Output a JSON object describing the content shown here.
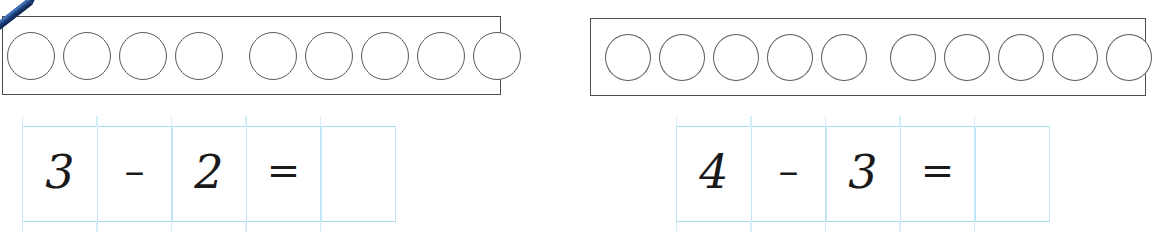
{
  "page": {
    "background_color": "#ffffff"
  },
  "colors": {
    "box_border": "#4d4d4d",
    "counter_outline": "#5a5a5a",
    "grid_line": "#a8dcef",
    "grid_line_light": "#d5eef8",
    "handwriting_ink": "#1a1a1a",
    "pencil_body": "#1f3f7a",
    "pencil_highlight": "#3f6fb5",
    "pencil_dark": "#132b55"
  },
  "decorations": {
    "pencil": {
      "icon": "pencil-icon",
      "position": "top-left-corner"
    }
  },
  "problems": [
    {
      "id": "problem-1",
      "counter_strip": {
        "total": 9,
        "groups": [
          {
            "count": 4,
            "filled": false
          },
          {
            "count": 5,
            "filled": false
          }
        ]
      },
      "equation": {
        "cells": [
          {
            "type": "number",
            "text": "3"
          },
          {
            "type": "operator",
            "text": "–"
          },
          {
            "type": "number",
            "text": "2"
          },
          {
            "type": "operator",
            "text": "="
          },
          {
            "type": "answer",
            "text": ""
          }
        ]
      }
    },
    {
      "id": "problem-2",
      "counter_strip": {
        "total": 10,
        "groups": [
          {
            "count": 5,
            "filled": false
          },
          {
            "count": 5,
            "filled": false
          }
        ]
      },
      "equation": {
        "cells": [
          {
            "type": "number",
            "text": "4"
          },
          {
            "type": "operator",
            "text": "–"
          },
          {
            "type": "number",
            "text": "3"
          },
          {
            "type": "operator",
            "text": "="
          },
          {
            "type": "answer",
            "text": ""
          }
        ]
      }
    }
  ]
}
